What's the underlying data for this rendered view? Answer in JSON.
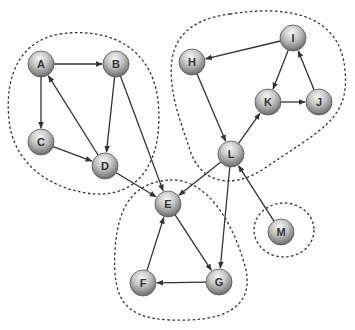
{
  "diagram": {
    "type": "directed-graph",
    "node_radius": 13,
    "colors": {
      "node_light": "#f4f4f4",
      "node_mid": "#b9b9b9",
      "node_dark": "#6e6e6e",
      "node_stroke": "#555555",
      "edge": "#333333",
      "cluster_outline": "#333333",
      "label": "#333333"
    },
    "nodes": [
      {
        "id": "A",
        "label": "A",
        "x": 41,
        "y": 64
      },
      {
        "id": "B",
        "label": "B",
        "x": 116,
        "y": 64
      },
      {
        "id": "C",
        "label": "C",
        "x": 41,
        "y": 142
      },
      {
        "id": "D",
        "label": "D",
        "x": 105,
        "y": 166
      },
      {
        "id": "E",
        "label": "E",
        "x": 168,
        "y": 204
      },
      {
        "id": "F",
        "label": "F",
        "x": 143,
        "y": 283
      },
      {
        "id": "G",
        "label": "G",
        "x": 219,
        "y": 282
      },
      {
        "id": "H",
        "label": "H",
        "x": 192,
        "y": 62
      },
      {
        "id": "I",
        "label": "I",
        "x": 293,
        "y": 38
      },
      {
        "id": "J",
        "label": "J",
        "x": 319,
        "y": 102
      },
      {
        "id": "K",
        "label": "K",
        "x": 268,
        "y": 102
      },
      {
        "id": "L",
        "label": "L",
        "x": 231,
        "y": 154
      },
      {
        "id": "M",
        "label": "M",
        "x": 281,
        "y": 232
      }
    ],
    "edges": [
      {
        "from": "A",
        "to": "B"
      },
      {
        "from": "A",
        "to": "C"
      },
      {
        "from": "C",
        "to": "D"
      },
      {
        "from": "D",
        "to": "A"
      },
      {
        "from": "B",
        "to": "D"
      },
      {
        "from": "B",
        "to": "E"
      },
      {
        "from": "D",
        "to": "E"
      },
      {
        "from": "I",
        "to": "H"
      },
      {
        "from": "H",
        "to": "L"
      },
      {
        "from": "I",
        "to": "K"
      },
      {
        "from": "K",
        "to": "J"
      },
      {
        "from": "J",
        "to": "I"
      },
      {
        "from": "L",
        "to": "K"
      },
      {
        "from": "L",
        "to": "E"
      },
      {
        "from": "L",
        "to": "G"
      },
      {
        "from": "M",
        "to": "L"
      },
      {
        "from": "E",
        "to": "G"
      },
      {
        "from": "G",
        "to": "F"
      },
      {
        "from": "F",
        "to": "E"
      }
    ],
    "clusters": [
      {
        "id": "component-ABCD",
        "members": [
          "A",
          "B",
          "C",
          "D"
        ],
        "path": "M 60 34 C 100 28, 150 40, 158 100 C 164 160, 140 196, 96 194 C 60 192, 14 170, 9 120 C 4 70, 24 40, 60 34 Z"
      },
      {
        "id": "component-HIJKL",
        "members": [
          "H",
          "I",
          "J",
          "K",
          "L"
        ],
        "path": "M 230 14 C 280 6, 340 10, 345 70 C 350 120, 320 130, 262 170 C 230 190, 200 182, 190 150 C 180 120, 168 90, 172 60 C 176 30, 200 18, 230 14 Z"
      },
      {
        "id": "component-EFG",
        "members": [
          "E",
          "F",
          "G"
        ],
        "path": "M 170 180 C 210 178, 236 230, 246 270 C 254 310, 220 322, 170 320 C 125 318, 112 300, 115 250 C 118 200, 138 182, 170 180 Z"
      },
      {
        "id": "component-M",
        "members": [
          "M"
        ],
        "cx": 284,
        "cy": 230,
        "rx": 30,
        "ry": 27
      }
    ]
  }
}
